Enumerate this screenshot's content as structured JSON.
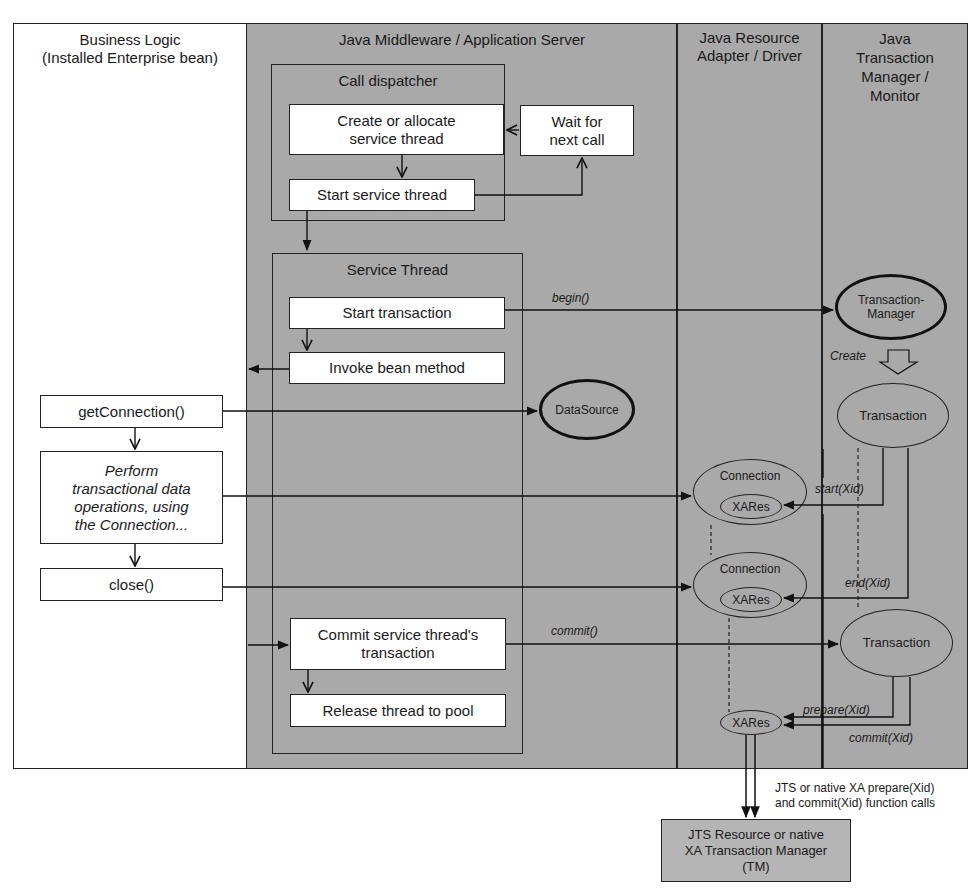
{
  "lanes": {
    "business_logic": {
      "line1": "Business Logic",
      "line2": "(Installed Enterprise bean)"
    },
    "middleware": {
      "title": "Java Middleware / Application Server"
    },
    "resource_adapter": {
      "line1": "Java Resource",
      "line2": "Adapter / Driver"
    },
    "transaction_manager": {
      "line1": "Java",
      "line2": "Transaction",
      "line3": "Manager /",
      "line4": "Monitor"
    }
  },
  "call_dispatcher": {
    "title": "Call dispatcher",
    "create_thread": {
      "line1": "Create or allocate",
      "line2": "service thread"
    },
    "wait_call": {
      "line1": "Wait for",
      "line2": "next call"
    },
    "start_thread": "Start service thread"
  },
  "service_thread": {
    "title": "Service Thread",
    "start_transaction": "Start transaction",
    "invoke_bean": "Invoke bean method",
    "commit": {
      "line1": "Commit service thread's",
      "line2": "transaction"
    },
    "release": "Release thread to pool"
  },
  "business_steps": {
    "get_connection": "getConnection()",
    "perform": {
      "line1": "Perform",
      "line2": "transactional data",
      "line3": "operations, using",
      "line4": "the Connection..."
    },
    "close": "close()"
  },
  "nodes": {
    "datasource": "DataSource",
    "transaction_manager": {
      "line1": "Transaction-",
      "line2": "Manager"
    },
    "transaction_1": "Transaction",
    "transaction_2": "Transaction",
    "connection_1": "Connection",
    "connection_2": "Connection",
    "xares_1": "XARes",
    "xares_2": "XARes",
    "xares_3": "XARes"
  },
  "labels": {
    "begin": "begin()",
    "create": "Create",
    "start_xid": "start(Xid)",
    "end_xid": "end(Xid)",
    "commit": "commit()",
    "prepare_xid": "prepare(Xid)",
    "commit_xid": "commit(Xid)"
  },
  "external": {
    "note": {
      "line1": "JTS or native XA prepare(Xid)",
      "line2": "and commit(Xid) function calls"
    },
    "tm_box": {
      "line1": "JTS Resource or native",
      "line2": "XA Transaction Manager",
      "line3": "(TM)"
    }
  }
}
